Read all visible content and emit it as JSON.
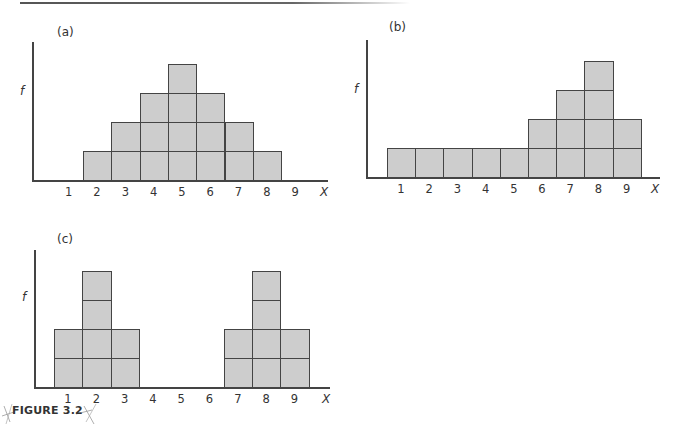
{
  "figure": {
    "caption": "FIGURE 3.2"
  },
  "chart_data": [
    {
      "type": "bar",
      "panel": "(a)",
      "title": "(a)",
      "xlabel": "X",
      "ylabel": "f",
      "categories": [
        "1",
        "2",
        "3",
        "4",
        "5",
        "6",
        "7",
        "8",
        "9"
      ],
      "values": [
        0,
        1,
        2,
        3,
        4,
        3,
        2,
        1,
        0
      ],
      "style": "stacked unit boxes (frequency histogram)",
      "grid": false,
      "legend": null
    },
    {
      "type": "bar",
      "panel": "(b)",
      "title": "(b)",
      "xlabel": "X",
      "ylabel": "f",
      "categories": [
        "1",
        "2",
        "3",
        "4",
        "5",
        "6",
        "7",
        "8",
        "9"
      ],
      "values": [
        1,
        1,
        1,
        1,
        1,
        2,
        3,
        4,
        2
      ],
      "style": "stacked unit boxes (frequency histogram)",
      "grid": false,
      "legend": null
    },
    {
      "type": "bar",
      "panel": "(c)",
      "title": "(c)",
      "xlabel": "X",
      "ylabel": "f",
      "categories": [
        "1",
        "2",
        "3",
        "4",
        "5",
        "6",
        "7",
        "8",
        "9"
      ],
      "values": [
        2,
        4,
        2,
        0,
        0,
        0,
        2,
        4,
        2
      ],
      "style": "stacked unit boxes (frequency histogram)",
      "grid": false,
      "legend": null
    }
  ],
  "colors": {
    "box_fill": "#cdcdcd",
    "box_border": "#444444",
    "axis": "#444444"
  }
}
